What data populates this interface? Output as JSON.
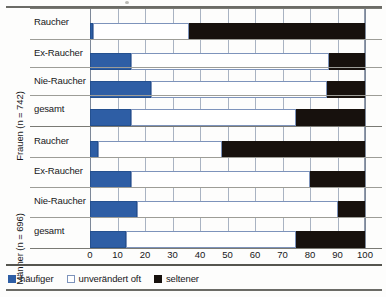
{
  "chart_data": {
    "type": "bar",
    "orientation": "horizontal",
    "stacked": true,
    "stacked_mode": "percent",
    "title": "",
    "subtitle": "",
    "xlabel": "",
    "ylabel": "",
    "xlim": [
      0,
      100
    ],
    "xticks": [
      0,
      10,
      20,
      30,
      40,
      50,
      60,
      70,
      80,
      90,
      100
    ],
    "xticklabels": [
      "0",
      "10",
      "20",
      "30",
      "40",
      "50",
      "60",
      "70",
      "80",
      "90",
      "100"
    ],
    "grid": "vertical",
    "legend_position": "bottom-left",
    "legend": [
      "häufiger",
      "unverändert oft",
      "seltener"
    ],
    "series": [
      {
        "name": "häufiger",
        "color": "#2e5ea5",
        "values": [
          1,
          15,
          22,
          15,
          3,
          15,
          17,
          13
        ]
      },
      {
        "name": "unverändert oft",
        "color": "#ffffff",
        "values": [
          35,
          72,
          64,
          60,
          45,
          65,
          73,
          62
        ]
      },
      {
        "name": "seltener",
        "color": "#17110d",
        "values": [
          64,
          13,
          14,
          25,
          52,
          20,
          10,
          25
        ]
      }
    ],
    "groups": [
      {
        "label": "Frauen (n = 742)",
        "categories": [
          "Raucher",
          "Ex-Raucher",
          "Nie-Raucher",
          "gesamt"
        ],
        "rows": [
          {
            "category": "Raucher",
            "haeufiger": 1,
            "unveraendert": 35,
            "seltener": 64
          },
          {
            "category": "Ex-Raucher",
            "haeufiger": 15,
            "unveraendert": 72,
            "seltener": 13
          },
          {
            "category": "Nie-Raucher",
            "haeufiger": 22,
            "unveraendert": 64,
            "seltener": 14
          },
          {
            "category": "gesamt",
            "haeufiger": 15,
            "unveraendert": 60,
            "seltener": 25
          }
        ]
      },
      {
        "label": "Männer (n = 696)",
        "categories": [
          "Raucher",
          "Ex-Raucher",
          "Nie-Raucher",
          "gesamt"
        ],
        "rows": [
          {
            "category": "Raucher",
            "haeufiger": 3,
            "unveraendert": 45,
            "seltener": 52
          },
          {
            "category": "Ex-Raucher",
            "haeufiger": 15,
            "unveraendert": 65,
            "seltener": 20
          },
          {
            "category": "Nie-Raucher",
            "haeufiger": 17,
            "unveraendert": 73,
            "seltener": 10
          },
          {
            "category": "gesamt",
            "haeufiger": 13,
            "unveraendert": 62,
            "seltener": 25
          }
        ]
      }
    ]
  },
  "axis": {
    "ticks": [
      "0",
      "10",
      "20",
      "30",
      "40",
      "50",
      "60",
      "70",
      "80",
      "90",
      "100"
    ]
  },
  "groups": {
    "frauen": {
      "label": "Frauen (n = 742)",
      "rows": [
        "Raucher",
        "Ex-Raucher",
        "Nie-Raucher",
        "gesamt"
      ]
    },
    "maenner": {
      "label": "Männer (n = 696)",
      "rows": [
        "Raucher",
        "Ex-Raucher",
        "Nie-Raucher",
        "gesamt"
      ]
    }
  },
  "legend": {
    "items": [
      {
        "label": "häufiger",
        "color": "#2e5ea5"
      },
      {
        "label": "unverändert oft",
        "color": "#ffffff"
      },
      {
        "label": "seltener",
        "color": "#17110d"
      }
    ]
  }
}
